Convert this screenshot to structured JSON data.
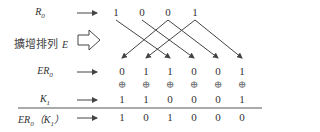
{
  "labels": {
    "r0": "R",
    "r0_sub": "0",
    "expansion": "擴增排列",
    "expansion_symbol": "E",
    "er0": "ER",
    "er0_sub": "0",
    "k1": "K",
    "k1_sub": "1",
    "result_a": "ER",
    "result_a_sub": "0",
    "result_b": "（K",
    "result_b_sub": "1",
    "result_c": "）",
    "xor_symbol": "⊕"
  },
  "rows": {
    "r0": [
      "1",
      "0",
      "0",
      "1"
    ],
    "er0": [
      "0",
      "1",
      "1",
      "0",
      "0",
      "1"
    ],
    "k1": [
      "1",
      "1",
      "0",
      "0",
      "0",
      "1"
    ],
    "result": [
      "1",
      "0",
      "1",
      "0",
      "0",
      "0"
    ]
  },
  "mapping": [
    {
      "from": 2,
      "to": 0
    },
    {
      "from": 3,
      "to": 1
    },
    {
      "from": 0,
      "to": 2
    },
    {
      "from": 1,
      "to": 3
    },
    {
      "from": 2,
      "to": 4
    },
    {
      "from": 3,
      "to": 5
    }
  ],
  "colors": {
    "ink": "#333333",
    "arrow": "#444444"
  }
}
